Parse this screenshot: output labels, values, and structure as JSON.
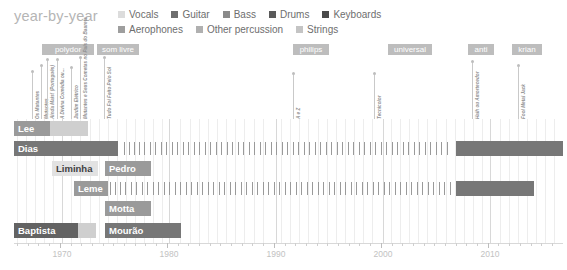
{
  "header": {
    "title": "year-by-year"
  },
  "legend": {
    "rows": [
      [
        {
          "label": "Vocals",
          "color": "#dcdcdc"
        },
        {
          "label": "Guitar",
          "color": "#6e6e6e"
        },
        {
          "label": "Bass",
          "color": "#8a8a8a"
        },
        {
          "label": "Drums",
          "color": "#5a5a5a"
        },
        {
          "label": "Keyboards",
          "color": "#4a4a4a"
        }
      ],
      [
        {
          "label": "Aerophones",
          "color": "#9e9e9e"
        },
        {
          "label": "Other percussion",
          "color": "#b0b0b0"
        },
        {
          "label": "Strings",
          "color": "#c4c4c4"
        }
      ]
    ]
  },
  "record_labels": [
    {
      "name": "polydor",
      "x": 42,
      "width": 52
    },
    {
      "name": "som livre",
      "x": 97,
      "width": 42
    },
    {
      "name": "philips",
      "x": 293,
      "width": 36
    },
    {
      "name": "universal",
      "x": 388,
      "width": 44
    },
    {
      "name": "anti",
      "x": 468,
      "width": 26
    },
    {
      "name": "krian",
      "x": 512,
      "width": 30
    }
  ],
  "albums": [
    {
      "title": "Os Mutantes",
      "x": 32,
      "stem": 46
    },
    {
      "title": "Mutantes",
      "x": 41,
      "stem": 52
    },
    {
      "title": "Ainda Mais! (Português)",
      "x": 47,
      "stem": 58
    },
    {
      "title": "A Divina Comédia ou...",
      "x": 57,
      "stem": 58
    },
    {
      "title": "Jardim Elétrico",
      "x": 71,
      "stem": 50
    },
    {
      "title": "Mutantes e Seus Cometas no País do Baurets",
      "x": 80,
      "stem": 60
    },
    {
      "title": "Tudo Foi Feito Pelo Sol",
      "x": 104,
      "stem": 60
    },
    {
      "title": "A e Z",
      "x": 293,
      "stem": 44
    },
    {
      "title": "Tecnicolor",
      "x": 374,
      "stem": 44
    },
    {
      "title": "Haih ou Amortecedor",
      "x": 472,
      "stem": 56
    },
    {
      "title": "Fool Metal Jack",
      "x": 518,
      "stem": 52
    }
  ],
  "axis": {
    "ticks": [
      {
        "year": 1966,
        "x": 17,
        "major": false,
        "label": ""
      },
      {
        "year": 1967,
        "x": 26,
        "major": false,
        "label": ""
      },
      {
        "year": 1968,
        "x": 35,
        "major": false,
        "label": ""
      },
      {
        "year": 1969,
        "x": 44,
        "major": false,
        "label": ""
      },
      {
        "year": 1970,
        "x": 62,
        "major": true,
        "label": "1970"
      },
      {
        "year": 1980,
        "x": 169,
        "major": true,
        "label": "1980"
      },
      {
        "year": 1990,
        "x": 276,
        "major": true,
        "label": "1990"
      },
      {
        "year": 2000,
        "x": 383,
        "major": true,
        "label": "2000"
      },
      {
        "year": 2010,
        "x": 490,
        "major": true,
        "label": "2010"
      }
    ],
    "range": [
      1965,
      2016
    ]
  },
  "chart_data": {
    "type": "table",
    "title": "year-by-year",
    "xlabel": "",
    "ylabel": "",
    "xlim": [
      1965,
      2016
    ],
    "grid": true,
    "legend_position": "top",
    "categories": [
      "Vocals",
      "Guitar",
      "Bass",
      "Drums",
      "Keyboards",
      "Aerophones",
      "Other percussion",
      "Strings"
    ],
    "rows": [
      {
        "name": "Lee",
        "y": 2,
        "segments": [
          {
            "x": 14,
            "width": 36,
            "color": "#9a9a9a",
            "label": "Lee",
            "label_color": "light"
          },
          {
            "x": 50,
            "width": 38,
            "color": "#cfcfcf",
            "label": "",
            "label_color": "light"
          }
        ],
        "ticks": []
      },
      {
        "name": "Dias",
        "y": 22,
        "segments": [
          {
            "x": 14,
            "width": 104,
            "color": "#777777",
            "label": "Dias",
            "label_color": "light"
          },
          {
            "x": 456,
            "width": 107,
            "color": "#777777",
            "label": "",
            "label_color": "light"
          }
        ],
        "ticks": [
          124,
          129,
          134,
          139,
          144,
          150,
          155,
          161,
          166,
          172,
          177,
          183,
          188,
          194,
          199,
          205,
          210,
          216,
          221,
          227,
          232,
          238,
          243,
          249,
          254,
          260,
          265,
          271,
          276,
          282,
          287,
          293,
          298,
          304,
          309,
          315,
          320,
          326,
          331,
          337,
          342,
          348,
          353,
          359,
          364,
          370,
          375,
          381,
          386,
          392,
          397,
          403,
          408,
          414,
          419,
          425,
          430,
          436,
          441,
          447
        ]
      },
      {
        "name": "Liminha",
        "y": 42,
        "segments": [
          {
            "x": 52,
            "width": 46,
            "color": "#e2e2e2",
            "label": "Liminha",
            "label_color": "dark"
          },
          {
            "x": 105,
            "width": 46,
            "color": "#9a9a9a",
            "label": "Pedro",
            "label_color": "light"
          }
        ],
        "ticks": []
      },
      {
        "name": "Leme",
        "y": 62,
        "segments": [
          {
            "x": 74,
            "width": 34,
            "color": "#9a9a9a",
            "label": "Leme",
            "label_color": "light"
          },
          {
            "x": 456,
            "width": 78,
            "color": "#777777",
            "label": "",
            "label_color": "light"
          }
        ],
        "ticks": [
          110,
          115,
          120,
          125,
          131,
          136,
          142,
          147,
          153,
          158,
          164,
          169,
          175,
          180,
          186,
          191,
          197,
          202,
          208,
          213,
          219,
          224,
          230,
          235,
          241,
          246,
          252,
          257,
          263,
          268,
          274,
          279,
          285,
          290,
          296,
          301,
          307,
          312,
          318,
          323,
          329,
          334,
          340,
          345,
          351,
          356,
          362,
          367,
          373,
          378,
          384,
          389,
          395,
          400,
          406,
          411,
          417,
          422,
          428,
          433,
          439,
          444,
          450
        ]
      },
      {
        "name": "Motta",
        "y": 82,
        "segments": [
          {
            "x": 105,
            "width": 46,
            "color": "#9a9a9a",
            "label": "Motta",
            "label_color": "light"
          }
        ],
        "ticks": []
      },
      {
        "name": "Baptista",
        "y": 104,
        "segments": [
          {
            "x": 14,
            "width": 64,
            "color": "#636363",
            "label": "Baptista",
            "label_color": "light"
          },
          {
            "x": 78,
            "width": 18,
            "color": "#cfcfcf",
            "label": "",
            "label_color": "light"
          },
          {
            "x": 105,
            "width": 76,
            "color": "#777777",
            "label": "Mourão",
            "label_color": "light"
          }
        ],
        "ticks": []
      }
    ]
  },
  "grid": {
    "minor_x": [
      17,
      26,
      35,
      44,
      53,
      62,
      71,
      80,
      90,
      99,
      108,
      117,
      126,
      135,
      144,
      153,
      162,
      169,
      180,
      190,
      199,
      208,
      217,
      226,
      235,
      244,
      254,
      263,
      276,
      281,
      290,
      299,
      308,
      318,
      327,
      336,
      345,
      354,
      363,
      372,
      383,
      391,
      400,
      409,
      418,
      427,
      436,
      446,
      455,
      464,
      473,
      482,
      490,
      500,
      509,
      518,
      527,
      536,
      545,
      554
    ],
    "major_x": [
      62,
      169,
      276,
      383,
      490
    ]
  }
}
